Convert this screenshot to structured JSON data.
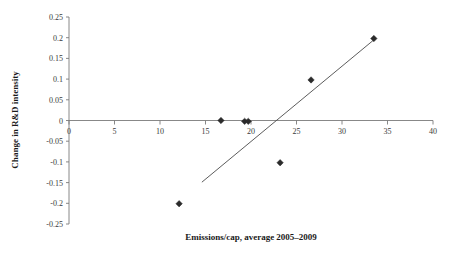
{
  "chart_data": {
    "type": "scatter",
    "title": "",
    "xlabel": "Emissions/cap, average 2005–2009",
    "ylabel": "Change in R&D intensity",
    "xlim": [
      0,
      40
    ],
    "ylim": [
      -0.25,
      0.25
    ],
    "xticks": [
      0,
      5,
      10,
      15,
      20,
      25,
      30,
      35,
      40
    ],
    "xtick_labels": [
      "0",
      "5",
      "10",
      "15",
      "20",
      "25",
      "30",
      "35",
      "40"
    ],
    "yticks": [
      -0.25,
      -0.2,
      -0.15,
      -0.1,
      -0.05,
      0,
      0.05,
      0.1,
      0.15,
      0.2,
      0.25
    ],
    "ytick_labels": [
      "-0.25",
      "-0.2",
      "-0.15",
      "-0.1",
      "-0.05",
      "0",
      "0.05",
      "0.1",
      "0.15",
      "0.2",
      "0.25"
    ],
    "grid": false,
    "legend": false,
    "marker_shape": "diamond",
    "marker_color": "#2b2b2b",
    "line_color": "#4a4a4a",
    "axis_color": "#7a7a7a",
    "zero_line": true,
    "series": [
      {
        "name": "observations",
        "points": [
          {
            "x": 12.1,
            "y": -0.201
          },
          {
            "x": 16.7,
            "y": 0.0
          },
          {
            "x": 19.3,
            "y": -0.002
          },
          {
            "x": 19.7,
            "y": -0.002
          },
          {
            "x": 23.2,
            "y": -0.102
          },
          {
            "x": 26.6,
            "y": 0.098
          },
          {
            "x": 33.5,
            "y": 0.198
          }
        ]
      }
    ],
    "trendline": {
      "name": "linear fit",
      "x_start": 14.6,
      "y_start": -0.149,
      "x_end": 33.4,
      "y_end": 0.193
    }
  }
}
